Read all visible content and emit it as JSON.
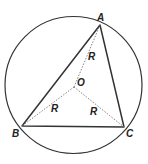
{
  "diagram": {
    "type": "circumscribed-triangle",
    "circle": {
      "cx": 73.5,
      "cy": 85,
      "r": 68.5,
      "stroke": "#333333"
    },
    "center": {
      "label": "O",
      "x": 74,
      "y": 87
    },
    "vertices": [
      {
        "label": "A",
        "x": 100,
        "y": 25
      },
      {
        "label": "B",
        "x": 22,
        "y": 126
      },
      {
        "label": "C",
        "x": 124,
        "y": 127
      }
    ],
    "radius_labels": [
      "R",
      "R",
      "R"
    ],
    "colors": {
      "line": "#333333",
      "dotted": "#777777",
      "text": "#222222"
    }
  }
}
